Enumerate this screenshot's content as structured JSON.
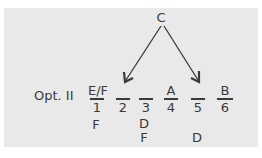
{
  "diagram": {
    "source_label": "C",
    "option_label": "Opt. II",
    "slots": [
      {
        "number": "1",
        "above": "E/F",
        "below": [
          "F"
        ]
      },
      {
        "number": "2",
        "above": "",
        "below": []
      },
      {
        "number": "3",
        "above": "",
        "below": [
          "D",
          "F"
        ]
      },
      {
        "number": "4",
        "above": "A",
        "below": []
      },
      {
        "number": "5",
        "above": "",
        "below": [
          "",
          "D"
        ]
      },
      {
        "number": "6",
        "above": "B",
        "below": []
      }
    ],
    "arrows": [
      {
        "from": "C",
        "to_slot": "2"
      },
      {
        "from": "C",
        "to_slot": "5"
      }
    ]
  }
}
